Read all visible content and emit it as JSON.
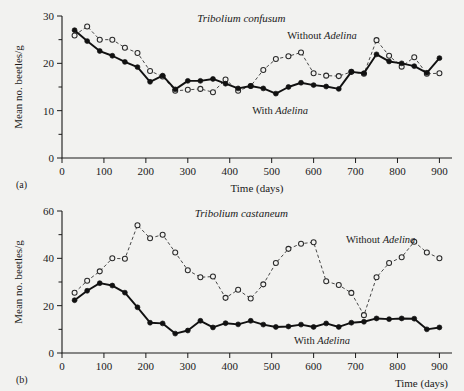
{
  "figure": {
    "background": "#f2f2f0",
    "panels": [
      {
        "letter": "(a)",
        "name": "panel-a"
      },
      {
        "letter": "(b)",
        "name": "panel-b"
      }
    ]
  },
  "panel_a": {
    "letter": "(a)",
    "title": "Tribolium confusum",
    "ylabel": "Mean no. beetles/g",
    "xlabel": "Time (days)",
    "xlabel_position": "center",
    "annotation_without": "Without ",
    "annotation_without_italic": "Adelina",
    "annotation_with": "With ",
    "annotation_with_italic": "Adelina",
    "xticks": [
      "0",
      "100",
      "200",
      "300",
      "400",
      "500",
      "600",
      "700",
      "800",
      "900"
    ],
    "yticks": [
      "0",
      "10",
      "20",
      "30"
    ]
  },
  "panel_b": {
    "letter": "(b)",
    "title": "Tribolium castaneum",
    "ylabel": "Mean no. beetles/g",
    "xlabel": "Time (days)",
    "xlabel_position": "right",
    "annotation_without": "Without ",
    "annotation_without_italic": "Adelina",
    "annotation_with": "With ",
    "annotation_with_italic": "Adelina",
    "xticks": [
      "0",
      "100",
      "200",
      "300",
      "400",
      "500",
      "600",
      "700",
      "800",
      "900"
    ],
    "yticks": [
      "0",
      "20",
      "40",
      "60"
    ]
  },
  "chart_data": [
    {
      "type": "line",
      "title": "Tribolium confusum",
      "panel": "(a)",
      "xlabel": "Time (days)",
      "ylabel": "Mean no. beetles/g",
      "xlim": [
        0,
        930
      ],
      "ylim": [
        0,
        30
      ],
      "xticks": [
        0,
        100,
        200,
        300,
        400,
        500,
        600,
        700,
        800,
        900
      ],
      "yticks": [
        0,
        10,
        20,
        30
      ],
      "minor_ytick_step": 5,
      "grid": false,
      "legend": "inline-annotation",
      "series": [
        {
          "name": "Without Adelina",
          "marker": "open-circle",
          "linestyle": "dashed",
          "x": [
            30,
            60,
            90,
            120,
            150,
            180,
            210,
            240,
            270,
            300,
            330,
            360,
            390,
            420,
            450,
            480,
            510,
            540,
            570,
            600,
            630,
            660,
            690,
            720,
            750,
            780,
            810,
            840,
            870,
            900
          ],
          "y": [
            25.9,
            27.8,
            25.0,
            25.0,
            23.3,
            22.2,
            18.4,
            17.2,
            14.2,
            14.4,
            14.6,
            13.9,
            16.6,
            14.2,
            15.2,
            18.6,
            20.9,
            21.5,
            22.3,
            17.9,
            17.4,
            17.3,
            18.2,
            17.8,
            24.9,
            21.6,
            19.3,
            21.3,
            17.8,
            17.9
          ]
        },
        {
          "name": "With Adelina",
          "marker": "filled-circle",
          "linestyle": "solid",
          "x": [
            30,
            60,
            90,
            120,
            150,
            180,
            210,
            240,
            270,
            300,
            330,
            360,
            390,
            420,
            450,
            480,
            510,
            540,
            570,
            600,
            630,
            660,
            690,
            720,
            750,
            780,
            810,
            840,
            870,
            900
          ],
          "y": [
            27.0,
            24.7,
            22.6,
            21.6,
            20.3,
            19.2,
            16.1,
            17.4,
            14.5,
            16.3,
            16.3,
            16.7,
            15.7,
            14.7,
            15.2,
            14.7,
            13.6,
            15.0,
            15.9,
            15.4,
            15.1,
            14.6,
            18.2,
            17.9,
            21.9,
            20.4,
            20.0,
            19.4,
            18.0,
            21.1
          ]
        }
      ]
    },
    {
      "type": "line",
      "title": "Tribolium castaneum",
      "panel": "(b)",
      "xlabel": "Time (days)",
      "ylabel": "Mean no. beetles/g",
      "xlim": [
        0,
        930
      ],
      "ylim": [
        0,
        60
      ],
      "xticks": [
        0,
        100,
        200,
        300,
        400,
        500,
        600,
        700,
        800,
        900
      ],
      "yticks": [
        0,
        20,
        40,
        60
      ],
      "minor_ytick_step": 10,
      "grid": false,
      "legend": "inline-annotation",
      "series": [
        {
          "name": "Without Adelina",
          "marker": "open-circle",
          "linestyle": "dashed",
          "x": [
            30,
            60,
            90,
            120,
            150,
            180,
            210,
            240,
            270,
            300,
            330,
            360,
            390,
            420,
            450,
            480,
            510,
            540,
            570,
            600,
            630,
            660,
            690,
            720,
            750,
            780,
            810,
            840,
            870,
            900
          ],
          "y": [
            25.5,
            30.5,
            34.5,
            40.0,
            39.8,
            54.0,
            48.5,
            50.0,
            42.5,
            35.0,
            32.0,
            32.3,
            23.3,
            26.7,
            23.0,
            29.0,
            38.0,
            44.0,
            46.2,
            46.8,
            30.3,
            28.7,
            25.4,
            16.0,
            32.0,
            38.0,
            40.5,
            47.0,
            42.5,
            40.0
          ]
        },
        {
          "name": "With Adelina",
          "marker": "filled-circle",
          "linestyle": "solid",
          "x": [
            30,
            60,
            90,
            120,
            150,
            180,
            210,
            240,
            270,
            300,
            330,
            360,
            390,
            420,
            450,
            480,
            510,
            540,
            570,
            600,
            630,
            660,
            690,
            720,
            750,
            780,
            810,
            840,
            870,
            900
          ],
          "y": [
            22.3,
            26.3,
            29.5,
            28.5,
            25.5,
            19.3,
            12.8,
            12.5,
            8.2,
            9.5,
            13.6,
            10.8,
            12.6,
            12.1,
            13.6,
            12.0,
            11.0,
            11.2,
            12.0,
            11.0,
            12.5,
            11.0,
            12.8,
            13.2,
            14.6,
            14.3,
            14.6,
            14.5,
            10.0,
            10.8
          ]
        }
      ]
    }
  ]
}
